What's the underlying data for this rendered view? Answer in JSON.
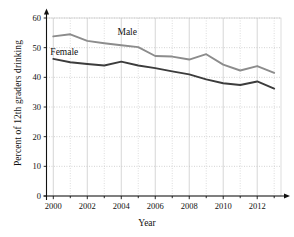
{
  "chart_data": {
    "type": "line",
    "title": "",
    "xlabel": "Year",
    "ylabel": "Percent of 12th graders drinking",
    "x": [
      2000,
      2001,
      2002,
      2003,
      2004,
      2005,
      2006,
      2007,
      2008,
      2009,
      2010,
      2011,
      2012,
      2013
    ],
    "xlim": [
      1999.6,
      2013.4
    ],
    "ylim": [
      0,
      62
    ],
    "xticks": [
      2000,
      2002,
      2004,
      2006,
      2008,
      2010,
      2012
    ],
    "xticklabels": [
      "2000",
      "2002",
      "2004",
      "2006",
      "2008",
      "2010",
      "2012"
    ],
    "xminorticks": [
      2001,
      2003,
      2005,
      2007,
      2009,
      2011,
      2013
    ],
    "yticks": [
      0,
      10,
      20,
      30,
      40,
      50,
      60
    ],
    "yticklabels": [
      "0",
      "10",
      "20",
      "30",
      "40",
      "50",
      "60"
    ],
    "grid": true,
    "legend_position": "inline-annotations",
    "series": [
      {
        "name": "Male",
        "color": "#8c8c8c",
        "label_x": 2004.35,
        "label_y": 54.2,
        "values": [
          53.8,
          54.5,
          52.3,
          51.5,
          50.8,
          50.2,
          47.2,
          47.0,
          46.0,
          47.8,
          44.3,
          42.3,
          43.8,
          41.5
        ]
      },
      {
        "name": "Female",
        "color": "#3c3c3c",
        "label_x": 2000.65,
        "label_y": 47.5,
        "values": [
          46.2,
          45.1,
          44.5,
          44.0,
          45.3,
          44.0,
          43.1,
          42.0,
          41.0,
          39.3,
          38.0,
          37.4,
          38.6,
          36.2
        ]
      }
    ]
  },
  "axis": {
    "x_label": "Year",
    "y_label": "Percent of 12th graders drinking"
  }
}
